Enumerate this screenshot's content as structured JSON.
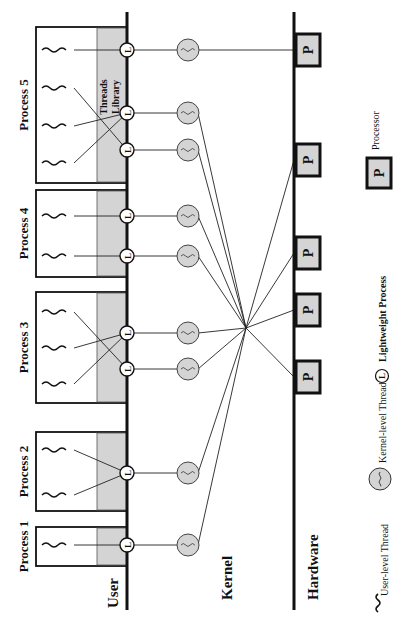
{
  "layers": {
    "user": "User",
    "kernel": "Kernel",
    "hardware": "Hardware"
  },
  "processes": [
    {
      "label": "Process 1",
      "y0": 527,
      "y1": 566,
      "threads": [
        545
      ],
      "lwps": [
        545
      ],
      "links": [
        [
          0,
          0
        ]
      ]
    },
    {
      "label": "Process 2",
      "y0": 432,
      "y1": 511,
      "threads": [
        450,
        495
      ],
      "lwps": [
        473
      ],
      "links": [
        [
          0,
          0
        ],
        [
          1,
          0
        ]
      ]
    },
    {
      "label": "Process 3",
      "y0": 292,
      "y1": 403,
      "threads": [
        312,
        348,
        384
      ],
      "lwps": [
        333,
        369
      ],
      "links": [
        [
          0,
          1
        ],
        [
          1,
          0
        ],
        [
          2,
          0
        ]
      ]
    },
    {
      "label": "Process 4",
      "y0": 190,
      "y1": 277,
      "threads": [
        216,
        256
      ],
      "lwps": [
        216,
        256
      ],
      "links": [
        [
          0,
          0
        ],
        [
          1,
          1
        ]
      ]
    },
    {
      "label": "Process 5",
      "y0": 27,
      "y1": 183,
      "threads": [
        50,
        88,
        126,
        163
      ],
      "lwps": [
        50,
        113,
        150
      ],
      "links": [
        [
          0,
          0
        ],
        [
          1,
          2
        ],
        [
          2,
          1
        ],
        [
          3,
          1
        ]
      ]
    }
  ],
  "threads_library_label": [
    "Threads",
    "Library"
  ],
  "kernel_threads_y": [
    50,
    113,
    150,
    216,
    256,
    333,
    369,
    473,
    545
  ],
  "processors": [
    {
      "label": "P",
      "y": 50,
      "linked_kernel_index": 0
    },
    {
      "label": "P",
      "y": 160,
      "linked_kernel_index": null
    },
    {
      "label": "P",
      "y": 253,
      "linked_kernel_index": null
    },
    {
      "label": "P",
      "y": 310,
      "linked_kernel_index": null
    },
    {
      "label": "P",
      "y": 377,
      "linked_kernel_index": null
    }
  ],
  "lwp_glyph": "L",
  "legend": {
    "user_thread": "User-level Thread",
    "kernel_thread": "Kernel-level Thread",
    "lwp": "Lightweight Process",
    "processor": "Processor",
    "processor_glyph": "P",
    "lwp_glyph": "L"
  },
  "colors": {
    "fill_gray": "#d4d4d4",
    "line": "#111111",
    "background": "#ffffff"
  }
}
